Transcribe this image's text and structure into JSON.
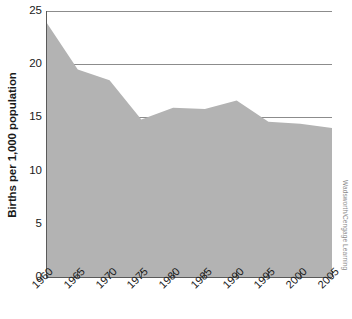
{
  "chart_data": {
    "type": "area",
    "title": "",
    "xlabel": "",
    "ylabel": "Births per 1,000 population",
    "categories": [
      "1960",
      "1965",
      "1970",
      "1975",
      "1980",
      "1985",
      "1990",
      "1995",
      "2000",
      "2005"
    ],
    "x": [
      1960,
      1965,
      1970,
      1975,
      1980,
      1985,
      1990,
      1995,
      2000,
      2005
    ],
    "values": [
      24.0,
      19.5,
      18.5,
      14.8,
      15.9,
      15.8,
      16.6,
      14.6,
      14.4,
      14.0
    ],
    "series": [
      {
        "name": "Birth rate",
        "values": [
          24.0,
          19.5,
          18.5,
          14.8,
          15.9,
          15.8,
          16.6,
          14.6,
          14.4,
          14.0
        ]
      }
    ],
    "ylim": [
      0,
      25
    ],
    "xlim": [
      1960,
      2005
    ],
    "yticks": [
      0,
      5,
      10,
      15,
      20,
      25
    ],
    "ytick_labels": [
      "0",
      "5",
      "10",
      "15",
      "20",
      "25"
    ],
    "xticks": [
      1960,
      1965,
      1970,
      1975,
      1980,
      1985,
      1990,
      1995,
      2000,
      2005
    ],
    "xtick_labels": [
      "1960",
      "1965",
      "1970",
      "1975",
      "1980",
      "1985",
      "1990",
      "1995",
      "2000",
      "2005"
    ],
    "grid": true,
    "grid_axis": "y",
    "legend": false,
    "legend_position": "none",
    "fill_color": "#b3b3b3",
    "grid_color": "#8c8c8c",
    "axis_color": "#5a5a5a",
    "text_color": "#1a1a1a",
    "background_color": "#ffffff",
    "xtick_label_rotation": -45
  },
  "credit": {
    "text": "Wadsworth/Cengage Learning",
    "color": "#8a8a8a"
  }
}
